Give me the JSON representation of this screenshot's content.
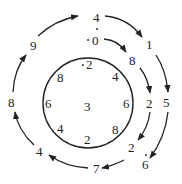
{
  "diagram": {
    "outer_ring": {
      "digits": [
        "4",
        "1",
        "5",
        "6",
        "7",
        "4",
        "8",
        "9"
      ],
      "direction": "clockwise",
      "repeating_dot_marks": [
        "4",
        "6"
      ]
    },
    "middle_ring": {
      "digits": [
        "0",
        "8",
        "2",
        "2",
        "7"
      ],
      "repeating_dot_marks": [
        "0"
      ]
    },
    "inner_circle": {
      "digits": [
        "2",
        "4",
        "6",
        "8",
        "2",
        "4",
        "6",
        "8"
      ],
      "center": "3",
      "repeating_dot_marks": [
        "2"
      ]
    }
  }
}
